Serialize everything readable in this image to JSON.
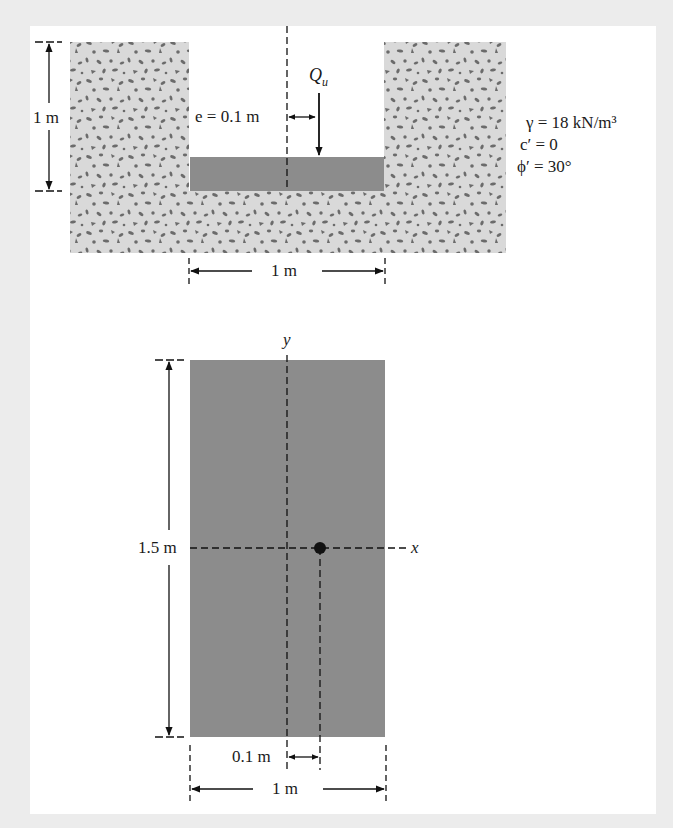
{
  "figure": {
    "section_view": {
      "depth_label": "1 m",
      "eccentricity_label": "e = 0.1 m",
      "load_label_main": "Q",
      "load_label_sub": "u",
      "width_label": "1 m"
    },
    "soil_properties": {
      "unit_weight": "γ = 18 kN/m³",
      "cohesion": "c′ = 0",
      "friction_angle": "ϕ′ = 30°"
    },
    "plan_view": {
      "y_axis_label": "y",
      "x_axis_label": "x",
      "length_label": "1.5 m",
      "eccentricity_label": "0.1 m",
      "width_label": "1 m"
    },
    "colors": {
      "background": "#ececec",
      "panel": "#ffffff",
      "soil": "#d9d9d9",
      "soil_grain": "#6b6b6b",
      "footing": "#8c8c8c",
      "line": "#111111"
    }
  }
}
